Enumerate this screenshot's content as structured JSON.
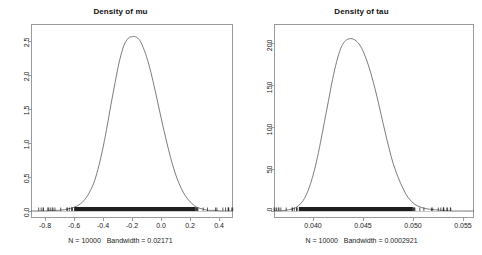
{
  "figure": {
    "background": "#ffffff",
    "frame_color": "#9a9a9a",
    "line_color": "#5a5a5a"
  },
  "chart_data": [
    {
      "type": "line",
      "title": "Density of mu",
      "subtitle": "N = 10000   Bandwidth = 0.02171",
      "xlabel": "",
      "ylabel": "",
      "xlim": [
        -0.93,
        0.46
      ],
      "ylim": [
        -0.07,
        2.78
      ],
      "xticks": [
        -0.8,
        -0.6,
        -0.4,
        -0.2,
        0.0,
        0.2,
        0.4
      ],
      "xticklabels": [
        "-0.8",
        "-0.6",
        "-0.4",
        "-0.2",
        "0.0",
        "0.2",
        "0.4"
      ],
      "yticks": [
        0.0,
        0.5,
        1.0,
        1.5,
        2.0,
        2.5
      ],
      "yticklabels": [
        "0.0",
        "0.5",
        "1.0",
        "1.5",
        "2.0",
        "2.5"
      ],
      "grid": false,
      "legend": "none",
      "n": 10000,
      "bandwidth": 0.02171,
      "peak_x": -0.21,
      "peak_y": 2.69,
      "rug": true,
      "rug_dense_range": [
        -0.63,
        0.2
      ],
      "x": [
        -0.93,
        -0.88,
        -0.83,
        -0.78,
        -0.74,
        -0.7,
        -0.66,
        -0.62,
        -0.58,
        -0.54,
        -0.5,
        -0.47,
        -0.44,
        -0.41,
        -0.38,
        -0.35,
        -0.32,
        -0.29,
        -0.26,
        -0.24,
        -0.21,
        -0.18,
        -0.15,
        -0.12,
        -0.09,
        -0.06,
        -0.03,
        0.0,
        0.03,
        0.06,
        0.09,
        0.12,
        0.15,
        0.18,
        0.21,
        0.25,
        0.29,
        0.33,
        0.38,
        0.42,
        0.46
      ],
      "y": [
        0.0,
        0.0,
        0.0,
        0.01,
        0.01,
        0.02,
        0.04,
        0.07,
        0.13,
        0.24,
        0.42,
        0.64,
        0.92,
        1.26,
        1.64,
        2.0,
        2.33,
        2.56,
        2.67,
        2.69,
        2.69,
        2.63,
        2.48,
        2.27,
        2.0,
        1.7,
        1.39,
        1.1,
        0.83,
        0.6,
        0.42,
        0.28,
        0.18,
        0.11,
        0.06,
        0.03,
        0.01,
        0.01,
        0.0,
        0.0,
        0.0
      ]
    },
    {
      "type": "line",
      "title": "Density of tau",
      "subtitle": "N = 10000   Bandwidth = 0.0002921",
      "xlabel": "",
      "ylabel": "",
      "xlim": [
        0.0366,
        0.0564
      ],
      "ylim": [
        -5,
        205
      ],
      "xticks": [
        0.04,
        0.045,
        0.05,
        0.055
      ],
      "xticklabels": [
        "0.040",
        "0.045",
        "0.050",
        "0.055"
      ],
      "yticks": [
        0,
        50,
        100,
        150,
        200
      ],
      "yticklabels": [
        "0",
        "50",
        "100",
        "150",
        "200"
      ],
      "grid": false,
      "legend": "none",
      "n": 10000,
      "bandwidth": 0.0002921,
      "peak_x": 0.0444,
      "peak_y": 196,
      "rug": true,
      "rug_dense_range": [
        0.0391,
        0.0503
      ],
      "x": [
        0.0366,
        0.0372,
        0.0378,
        0.0383,
        0.0388,
        0.0392,
        0.0396,
        0.04,
        0.0404,
        0.0408,
        0.0412,
        0.0416,
        0.042,
        0.0424,
        0.0428,
        0.0432,
        0.0436,
        0.044,
        0.0444,
        0.0448,
        0.0452,
        0.0456,
        0.046,
        0.0464,
        0.0468,
        0.0472,
        0.0476,
        0.048,
        0.0484,
        0.0489,
        0.0494,
        0.0499,
        0.0505,
        0.0512,
        0.052,
        0.053,
        0.0542,
        0.0554,
        0.0564
      ],
      "y": [
        0,
        0,
        1,
        2,
        4,
        8,
        14,
        24,
        38,
        56,
        78,
        102,
        126,
        150,
        170,
        185,
        193,
        196,
        196,
        193,
        187,
        177,
        164,
        148,
        130,
        110,
        90,
        71,
        54,
        38,
        25,
        15,
        8,
        4,
        2,
        1,
        0,
        0,
        0
      ]
    }
  ]
}
